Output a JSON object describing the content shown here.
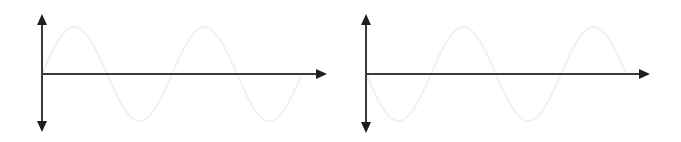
{
  "figure": {
    "background_color": "#ffffff",
    "width": 681,
    "height": 142,
    "panel_count": 2
  },
  "style": {
    "axis_color": "#3a3a3a",
    "axis_stroke_width": 2.0,
    "arrowhead_color": "#1f1f1f",
    "wave_color": "#f1f1f3",
    "wave_stroke_width": 2.0
  },
  "panels": [
    {
      "id": "panel-left",
      "name": "left-panel",
      "origin": {
        "x": 42,
        "y": 74
      },
      "axes": {
        "vertical": {
          "name": "y-axis",
          "top_tip_y": 14,
          "bottom_tip_y": 132,
          "arrow_top": true,
          "arrow_bottom": true
        },
        "horizontal": {
          "name": "x-axis",
          "start_x": 42,
          "tip_x": 327,
          "arrow_right": true,
          "arrow_left": false
        }
      },
      "wave": {
        "name": "sine-curve",
        "phase": "positive",
        "phase_label": "sin",
        "amplitude_px": 47,
        "period_px": 130,
        "start_x": 42,
        "end_x": 302,
        "cycles": 2,
        "first_peak": {
          "x": 78,
          "y": 27
        },
        "first_trough": {
          "x": 143,
          "y": 120
        },
        "zero_crossings": [
          42,
          107,
          172,
          237,
          302
        ]
      }
    },
    {
      "id": "panel-right",
      "name": "right-panel",
      "origin": {
        "x": 366,
        "y": 74
      },
      "axes": {
        "vertical": {
          "name": "y-axis",
          "top_tip_y": 14,
          "bottom_tip_y": 133,
          "arrow_top": true,
          "arrow_bottom": true
        },
        "horizontal": {
          "name": "x-axis",
          "start_x": 366,
          "tip_x": 650,
          "arrow_right": true,
          "arrow_left": false
        }
      },
      "wave": {
        "name": "sine-curve",
        "phase": "negative",
        "phase_label": "-sin",
        "amplitude_px": 47,
        "period_px": 130,
        "start_x": 366,
        "end_x": 626,
        "cycles": 2,
        "first_trough": {
          "x": 399,
          "y": 120
        },
        "first_peak": {
          "x": 464,
          "y": 27
        },
        "zero_crossings": [
          366,
          431,
          496,
          561,
          626
        ]
      }
    }
  ],
  "chart_data": {
    "type": "line",
    "title": "",
    "xlabel": "",
    "ylabel": "",
    "grid": false,
    "legend": "none",
    "xlim": [
      0,
      4
    ],
    "ylim": [
      -1.2,
      1.2
    ],
    "x_unit": "pi radians",
    "series": [
      {
        "name": "sine",
        "panel": "panel-left",
        "equation": "y = sin(pi*x)",
        "amplitude": 1,
        "phase_deg": 0,
        "periods_shown": 2,
        "x": [
          0,
          0.25,
          0.5,
          0.75,
          1,
          1.25,
          1.5,
          1.75,
          2,
          2.25,
          2.5,
          2.75,
          3,
          3.25,
          3.5,
          3.75,
          4
        ],
        "values": [
          0,
          0.707,
          1,
          0.707,
          0,
          -0.707,
          -1,
          -0.707,
          0,
          0.707,
          1,
          0.707,
          0,
          -0.707,
          -1,
          -0.707,
          0
        ]
      },
      {
        "name": "inverted sine",
        "panel": "panel-right",
        "equation": "y = -sin(pi*x)",
        "amplitude": 1,
        "phase_deg": 180,
        "periods_shown": 2,
        "x": [
          0,
          0.25,
          0.5,
          0.75,
          1,
          1.25,
          1.5,
          1.75,
          2,
          2.25,
          2.5,
          2.75,
          3,
          3.25,
          3.5,
          3.75,
          4
        ],
        "values": [
          0,
          -0.707,
          -1,
          -0.707,
          0,
          0.707,
          1,
          0.707,
          0,
          -0.707,
          -1,
          -0.707,
          0,
          0.707,
          1,
          0.707,
          0
        ]
      }
    ]
  }
}
